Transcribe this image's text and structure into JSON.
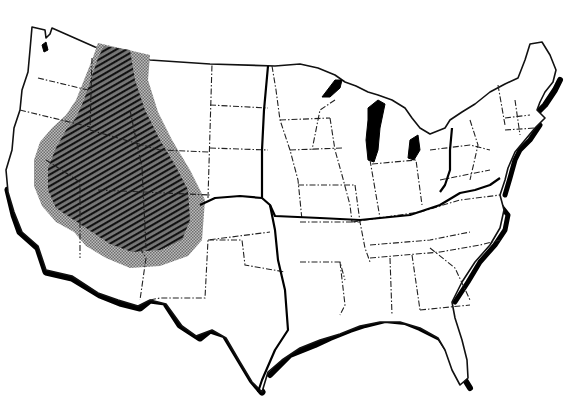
{
  "map": {
    "subject": "Contiguous United States outline map",
    "style": "black-and-white line drawing with state borders as dash-dot lines",
    "colors": {
      "background": "#ffffff",
      "outline": "#111111",
      "coast_shadow": "#000000",
      "core_region_hatch": "#3a3a3a",
      "halo_region_stipple": "#9a9a9a",
      "lakes": "#000000"
    },
    "regions": [
      {
        "name": "core-region",
        "fill": "dark diagonal hatching",
        "extent": "Interior West: Idaho, Nevada, Utah, western Montana/Wyoming, northern Arizona"
      },
      {
        "name": "halo-region",
        "fill": "light gray stipple",
        "extent": "Band surrounding core region from Canadian border through eastern Washington/Oregon, California interior to northern Arizona"
      }
    ],
    "boundary_lines": [
      {
        "name": "western-boundary-line",
        "description": "Thick solid line from Canadian border at North Dakota/Minnesota down through Kansas/Oklahoma/Texas to Gulf coast"
      },
      {
        "name": "southern-boundary-line",
        "description": "Thick solid line from Arizona/New Mexico east across Kansas, Missouri, Kentucky to Virginia coast"
      },
      {
        "name": "eastern-boundary-line",
        "description": "Thick solid line from Lake Erie south through Pennsylvania/Ohio border"
      }
    ],
    "labels": []
  }
}
